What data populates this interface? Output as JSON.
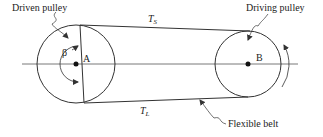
{
  "diagram": {
    "labels": {
      "driven_pulley": "Driven pulley",
      "driving_pulley": "Driving pulley",
      "flexible_belt": "Flexible belt",
      "center_a": "A",
      "center_b": "B",
      "angle": "β",
      "tension_slack_main": "T",
      "tension_slack_sub": "S",
      "tension_tight_main": "T",
      "tension_tight_sub": "L"
    },
    "colors": {
      "line": "#333333",
      "background": "#ffffff"
    }
  }
}
